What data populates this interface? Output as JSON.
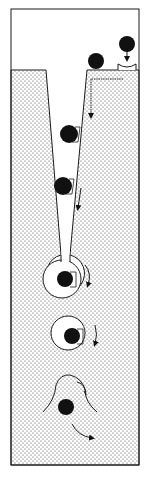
{
  "diagram": {
    "title": "",
    "colors": {
      "background": "#ffffff",
      "line": "#1a1a1a",
      "particle": "#111111",
      "stipple": "#444444"
    },
    "frame": {
      "x": 11,
      "y": 9,
      "width": 128,
      "height": 456
    },
    "medium_top_y": 70,
    "channel": {
      "top_left_x": 46,
      "top_right_x": 87,
      "top_y": 70,
      "bottom_left_x": 61,
      "bottom_right_x": 70,
      "bottom_y": 255
    },
    "particles": [
      {
        "id": "surface-particle-1",
        "cx": 96,
        "cy": 61,
        "r": 8
      },
      {
        "id": "dropping-particle",
        "cx": 127,
        "cy": 44,
        "r": 8
      },
      {
        "id": "channel-particle-1",
        "cx": 69,
        "cy": 134,
        "r": 9
      },
      {
        "id": "channel-particle-2",
        "cx": 63,
        "cy": 186,
        "r": 9
      },
      {
        "id": "cavity-particle-1",
        "cx": 65,
        "cy": 279,
        "r": 8
      },
      {
        "id": "cavity-particle-2",
        "cx": 72,
        "cy": 336,
        "r": 8
      },
      {
        "id": "released-particle",
        "cx": 66,
        "cy": 407,
        "r": 8
      }
    ],
    "cavities": [
      {
        "id": "cavity-1",
        "cx": 62,
        "cy": 279,
        "r": 19
      },
      {
        "id": "cavity-2",
        "cx": 68,
        "cy": 333,
        "r": 17
      }
    ],
    "labels": []
  }
}
